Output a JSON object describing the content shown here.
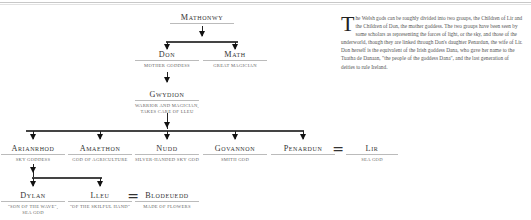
{
  "nodes": {
    "mathonwy": {
      "name": "Mathonwy",
      "desc": ""
    },
    "don": {
      "name": "Don",
      "desc": "Mother goddess"
    },
    "math": {
      "name": "Math",
      "desc": "Great magician"
    },
    "gwydion": {
      "name": "Gwydion",
      "desc1": "Warrior and magician,",
      "desc2": "takes care of Lleu"
    },
    "arianrhod": {
      "name": "Arianrhod",
      "desc": "Sky goddess"
    },
    "amaethon": {
      "name": "Amaethon",
      "desc": "God of agriculture"
    },
    "nudd": {
      "name": "Nudd",
      "desc": "Silver-handed sky god"
    },
    "govannon": {
      "name": "Govannon",
      "desc": "Smith god"
    },
    "penardun": {
      "name": "Penardun",
      "desc": ""
    },
    "lir": {
      "name": "Lir",
      "desc": "Sea god"
    },
    "dylan": {
      "name": "Dylan",
      "desc1": "\"Son of the wave\",",
      "desc2": "sea god"
    },
    "lleu": {
      "name": "Lleu",
      "desc": "\"Of the skilful hand\""
    },
    "blodeuedd": {
      "name": "Blodeuedd",
      "desc": "Made of flowers"
    }
  },
  "marriage_symbol": "=",
  "paragraph": {
    "dropcap": "T",
    "text": "he Welsh gods can be roughly divided into two groups, the Children of Lir and the Children of Don, the mother goddess. The two groups have been seen by some scholars as representing the forces of light, or the sky, and those of the underworld, though they are linked through Don's daughter Penardun, the wife of Lir. Don herself is the equivalent of the Irish goddess Dana, who gave her name to the Tuatha de Danaan, \"the people of the goddess Dana\", and the last generation of deities to rule Ireland."
  }
}
